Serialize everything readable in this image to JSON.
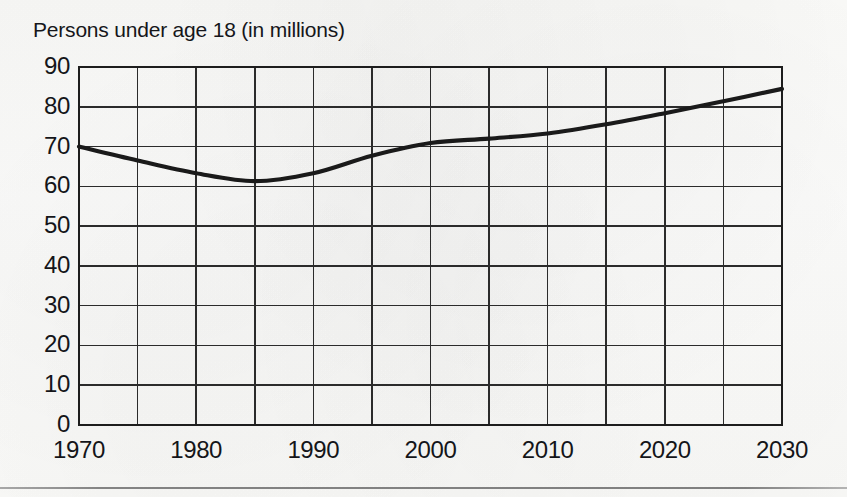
{
  "chart_data": {
    "type": "line",
    "title": "Persons under age 18 (in millions)",
    "xlabel": "",
    "ylabel": "",
    "grid": true,
    "legend": "none",
    "xlim": [
      1970,
      2030
    ],
    "ylim": [
      0,
      90
    ],
    "y_ticks": [
      90,
      80,
      70,
      60,
      50,
      40,
      30,
      20,
      10,
      0
    ],
    "y_tick_labels": [
      "90",
      "80",
      "70",
      "60",
      "50",
      "40",
      "30",
      "20",
      "10",
      "0"
    ],
    "x_ticks": [
      1970,
      1980,
      1990,
      2000,
      2010,
      2020,
      2030
    ],
    "x_tick_labels": [
      "1970",
      "1980",
      "1990",
      "2000",
      "2010",
      "2020",
      "2030"
    ],
    "x_gridlines": [
      1970,
      1975,
      1980,
      1985,
      1990,
      1995,
      2000,
      2005,
      2010,
      2015,
      2020,
      2025,
      2030
    ],
    "y_gridlines": [
      0,
      10,
      20,
      30,
      40,
      50,
      60,
      70,
      80,
      90
    ],
    "series": [
      {
        "name": "Persons under age 18",
        "color": "#1a1a1a",
        "x": [
          1970,
          1975,
          1980,
          1985,
          1990,
          1995,
          2000,
          2005,
          2010,
          2015,
          2020,
          2025,
          2030
        ],
        "values": [
          70.0,
          66.5,
          63.3,
          61.3,
          63.3,
          67.7,
          70.9,
          72.0,
          73.3,
          75.6,
          78.4,
          81.4,
          84.5
        ]
      }
    ]
  },
  "footer": {
    "rule": true
  }
}
